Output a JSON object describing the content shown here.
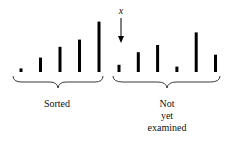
{
  "diagram": {
    "type": "insertion-sort-array-state",
    "marker_label": "x",
    "sorted_label": "Sorted",
    "unsorted_label_lines": [
      "Not",
      "yet",
      "examined"
    ],
    "sorted_values": [
      1,
      4,
      7,
      9,
      14
    ],
    "unsorted_values": [
      2,
      5.5,
      7.5,
      1.5,
      11,
      4.8
    ],
    "marker_index_in_unsorted": 0,
    "bar_color": "#000000"
  }
}
